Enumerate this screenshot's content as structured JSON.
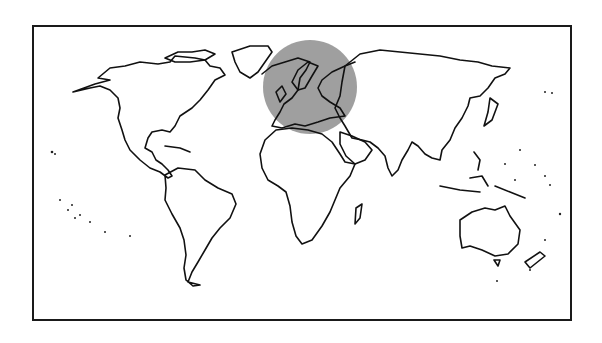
{
  "map": {
    "projection": "world-outline",
    "frame_color": "#1a1a1a",
    "land_stroke": "#111111",
    "background": "#ffffff",
    "highlight": {
      "region": "Europe",
      "shape": "circle",
      "color": "#9a9a9a",
      "center": [
        310,
        87
      ],
      "radius": 47
    },
    "continents": [
      "North America",
      "South America",
      "Europe",
      "Africa",
      "Asia",
      "Australia",
      "Greenland"
    ]
  }
}
